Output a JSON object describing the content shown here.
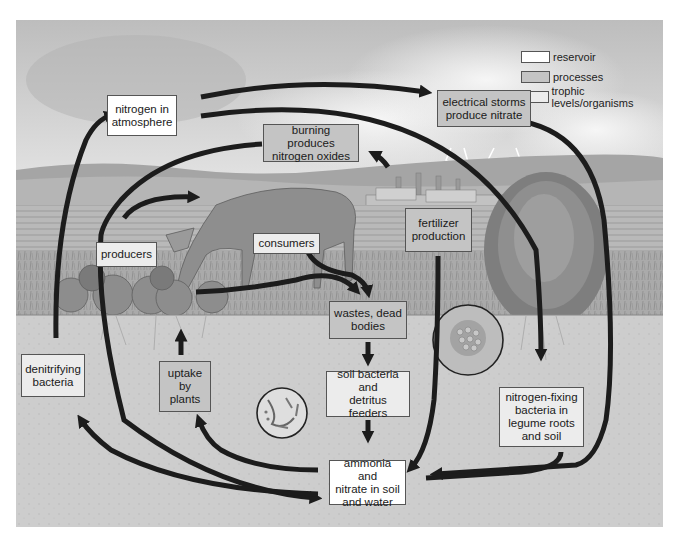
{
  "legend": {
    "items": [
      {
        "label": "reservoir",
        "kind": "reservoir",
        "color": "#ffffff"
      },
      {
        "label": "processes",
        "kind": "process",
        "color": "#c4c4c4"
      },
      {
        "label": "trophic levels/organisms",
        "kind": "trophic",
        "color": "#ececec"
      }
    ]
  },
  "nodes": {
    "atmosphere": {
      "label": "nitrogen in\natmosphere",
      "kind": "reservoir"
    },
    "storms": {
      "label": "electrical storms\nproduce nitrate",
      "kind": "process"
    },
    "burning": {
      "label": "burning produces\nnitrogen oxides",
      "kind": "process"
    },
    "fertilizer": {
      "label": "fertilizer\nproduction",
      "kind": "process"
    },
    "producers": {
      "label": "producers",
      "kind": "trophic"
    },
    "consumers": {
      "label": "consumers",
      "kind": "trophic"
    },
    "wastes": {
      "label": "wastes, dead\nbodies",
      "kind": "process"
    },
    "soil_bacteria": {
      "label": "soil bacteria\nand\ndetritus feeders",
      "kind": "trophic"
    },
    "denitrifying": {
      "label": "denitrifying\nbacteria",
      "kind": "trophic"
    },
    "uptake": {
      "label": "uptake\nby\nplants",
      "kind": "process"
    },
    "nitrogen_fixing": {
      "label": "nitrogen-fixing\nbacteria in\nlegume roots\nand soil",
      "kind": "trophic"
    },
    "ammonia": {
      "label": "ammonia and\nnitrate in soil\nand water",
      "kind": "reservoir"
    }
  },
  "edges": [
    {
      "from": "atmosphere",
      "to": "storms"
    },
    {
      "from": "atmosphere",
      "to": "nitrogen_fixing"
    },
    {
      "from": "storms",
      "to": "ammonia"
    },
    {
      "from": "burning",
      "to": "producers"
    },
    {
      "from": "fertilizer",
      "to": "burning"
    },
    {
      "from": "fertilizer",
      "to": "ammonia"
    },
    {
      "from": "denitrifying",
      "to": "atmosphere"
    },
    {
      "from": "producers",
      "to": "consumers"
    },
    {
      "from": "producers",
      "to": "wastes"
    },
    {
      "from": "consumers",
      "to": "wastes"
    },
    {
      "from": "wastes",
      "to": "soil_bacteria"
    },
    {
      "from": "soil_bacteria",
      "to": "ammonia"
    },
    {
      "from": "ammonia",
      "to": "uptake"
    },
    {
      "from": "uptake",
      "to": "producers"
    },
    {
      "from": "ammonia",
      "to": "denitrifying"
    },
    {
      "from": "producers",
      "to": "ammonia"
    },
    {
      "from": "nitrogen_fixing",
      "to": "ammonia"
    }
  ],
  "colors": {
    "arrow": "#1c1c1c",
    "sky": "#d2d2d2",
    "hills": "#a9a9a9",
    "field": "#b4b4b4",
    "soil": "#cfcfcf",
    "box_border": "#555555"
  }
}
